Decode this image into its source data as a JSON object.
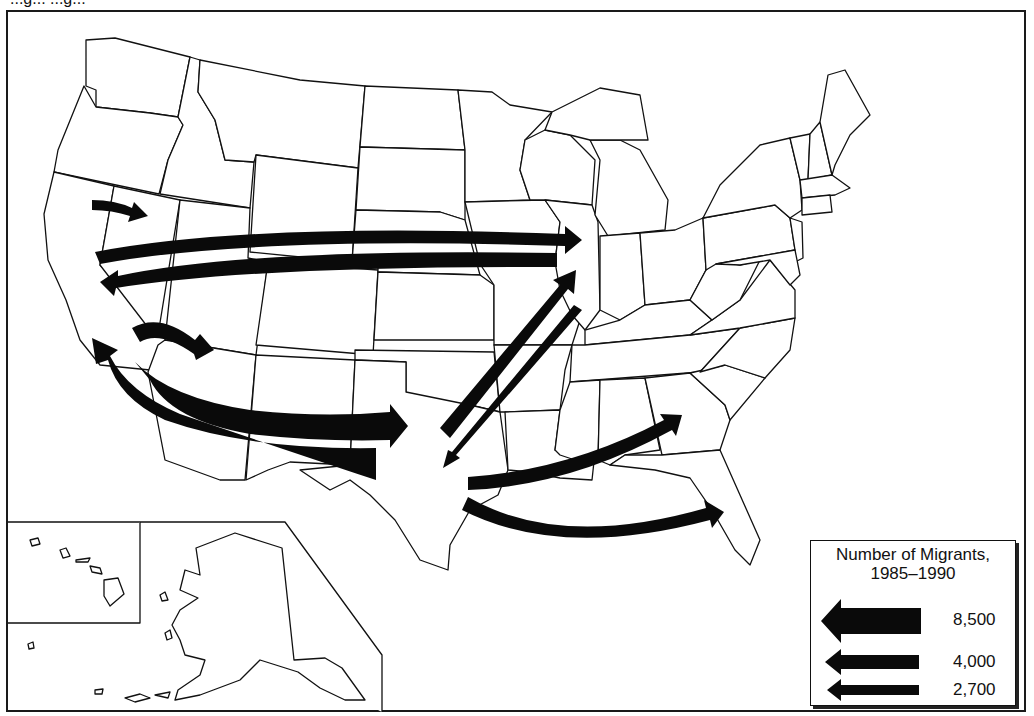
{
  "map": {
    "title_cropped": "...g... ...g...",
    "subject": "Major migration flows among US states",
    "legend": {
      "title_line1": "Number of Migrants,",
      "title_line2": "1985–1990",
      "entries": [
        {
          "label": "8,500",
          "width_px": 44
        },
        {
          "label": "4,000",
          "width_px": 22
        },
        {
          "label": "2,700",
          "width_px": 16
        }
      ]
    },
    "flows": [
      {
        "from": "Northern California",
        "to": "Nevada",
        "size": "2,700"
      },
      {
        "from": "California",
        "to": "Illinois",
        "size": "4,000"
      },
      {
        "from": "Illinois",
        "to": "California",
        "size": "4,000"
      },
      {
        "from": "Southern California",
        "to": "Arizona",
        "size": "4,000"
      },
      {
        "from": "California",
        "to": "Texas",
        "size": "8,500"
      },
      {
        "from": "Texas",
        "to": "California",
        "size": "8,500"
      },
      {
        "from": "Texas",
        "to": "Illinois",
        "size": "4,000"
      },
      {
        "from": "Illinois",
        "to": "Texas",
        "size": "2,700"
      },
      {
        "from": "Texas",
        "to": "Georgia",
        "size": "2,700"
      },
      {
        "from": "Texas",
        "to": "Florida",
        "size": "4,000"
      }
    ],
    "insets": [
      "Alaska",
      "Hawaii"
    ],
    "colors": {
      "arrow": "#0a0a0a",
      "border": "#111111",
      "background": "#ffffff"
    }
  }
}
